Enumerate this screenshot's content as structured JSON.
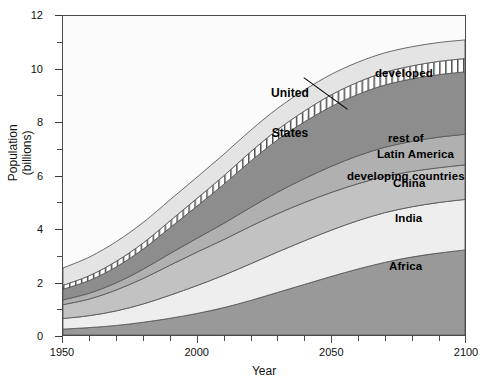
{
  "chart_data": {
    "type": "area",
    "title": "",
    "subtitle": "",
    "xlabel": "Year",
    "ylabel": "Population\n(billions)",
    "ylabel_line1": "Population",
    "ylabel_line2": "(billions)",
    "xlim": [
      1950,
      2100
    ],
    "ylim": [
      0,
      12
    ],
    "xticks": [
      1950,
      2000,
      2050,
      2100
    ],
    "xtick_labels": [
      "1950",
      "2000",
      "2050",
      "2100"
    ],
    "xtick_minor_step": 10,
    "yticks": [
      0,
      2,
      4,
      6,
      8,
      10,
      12
    ],
    "ytick_labels": [
      "0",
      "2",
      "4",
      "6",
      "8",
      "10",
      "12"
    ],
    "ytick_minor_step": 1,
    "grid": false,
    "legend": "in-plot labels",
    "stacked": true,
    "x": [
      1950,
      1960,
      1970,
      1980,
      1990,
      2000,
      2010,
      2020,
      2030,
      2040,
      2050,
      2060,
      2070,
      2080,
      2090,
      2100
    ],
    "series": [
      {
        "name": "Africa",
        "label": "Africa",
        "color": "#999999",
        "pattern": "solid",
        "values": [
          0.22,
          0.28,
          0.36,
          0.48,
          0.63,
          0.81,
          1.03,
          1.3,
          1.6,
          1.9,
          2.2,
          2.48,
          2.73,
          2.93,
          3.08,
          3.2
        ]
      },
      {
        "name": "India",
        "label": "India",
        "color": "#eeeeee",
        "pattern": "solid",
        "values": [
          0.4,
          0.45,
          0.55,
          0.69,
          0.87,
          1.05,
          1.22,
          1.38,
          1.52,
          1.64,
          1.74,
          1.82,
          1.87,
          1.89,
          1.9,
          1.9
        ]
      },
      {
        "name": "China",
        "label": "China",
        "color": "#c2c2c2",
        "pattern": "solid",
        "values": [
          0.52,
          0.63,
          0.79,
          0.96,
          1.13,
          1.26,
          1.34,
          1.41,
          1.44,
          1.44,
          1.42,
          1.39,
          1.36,
          1.33,
          1.31,
          1.3
        ]
      },
      {
        "name": "Latin America",
        "label": "Latin America",
        "color": "#b0b0b0",
        "pattern": "solid",
        "values": [
          0.18,
          0.22,
          0.27,
          0.35,
          0.44,
          0.52,
          0.61,
          0.71,
          0.81,
          0.9,
          0.98,
          1.05,
          1.1,
          1.13,
          1.15,
          1.15
        ]
      },
      {
        "name": "rest of developing countries",
        "label": "rest of\ndeveloping countries",
        "label_line1": "rest of",
        "label_line2": "developing countries",
        "color": "#8d8d8d",
        "pattern": "solid",
        "values": [
          0.4,
          0.48,
          0.6,
          0.76,
          0.97,
          1.21,
          1.47,
          1.74,
          1.97,
          2.13,
          2.25,
          2.31,
          2.34,
          2.35,
          2.35,
          2.35
        ]
      },
      {
        "name": "United States",
        "label": "United\nStates",
        "label_line1": "United",
        "label_line2": "States",
        "color": "#ffffff",
        "pattern": "vertical-hatch",
        "values": [
          0.15,
          0.18,
          0.21,
          0.23,
          0.26,
          0.29,
          0.32,
          0.35,
          0.38,
          0.41,
          0.44,
          0.46,
          0.48,
          0.49,
          0.5,
          0.5
        ]
      },
      {
        "name": "developed",
        "label": "developed",
        "color": "#e4e4e4",
        "pattern": "solid",
        "values": [
          0.65,
          0.7,
          0.74,
          0.77,
          0.79,
          0.8,
          0.81,
          0.81,
          0.8,
          0.79,
          0.77,
          0.75,
          0.73,
          0.72,
          0.71,
          0.7
        ]
      }
    ],
    "cumulative_top": {
      "1950": [
        0.22,
        0.62,
        1.14,
        1.32,
        1.72,
        1.87,
        2.52
      ],
      "2000": [
        0.81,
        1.86,
        3.12,
        3.64,
        4.85,
        5.14,
        5.94
      ],
      "2050": [
        2.2,
        3.94,
        5.36,
        6.34,
        8.59,
        9.03,
        9.8
      ],
      "2100": [
        3.2,
        5.1,
        6.4,
        7.55,
        9.9,
        10.4,
        11.1
      ]
    },
    "annotations": [
      {
        "name": "united-states-leader",
        "text": "United States",
        "points_to": "vertical-hatched band"
      }
    ]
  },
  "labels": {
    "united_states_line1": "United",
    "united_states_line2": "States",
    "developed": "developed",
    "rest_developing_line1": "rest of",
    "rest_developing_line2": "developing countries",
    "latin_america": "Latin America",
    "china": "China",
    "india": "India",
    "africa": "Africa"
  },
  "axes": {
    "x_title": "Year",
    "y_title_line1": "Population",
    "y_title_line2": "(billions)",
    "x_ticks": [
      "1950",
      "2000",
      "2050",
      "2100"
    ],
    "y_ticks": [
      "0",
      "2",
      "4",
      "6",
      "8",
      "10",
      "12"
    ]
  },
  "colors": {
    "plot_background": "#fbfbfb",
    "axis": "#4a4a4a",
    "band_outline": "#5a5a5a",
    "africa": "#999999",
    "india": "#eeeeee",
    "china": "#c2c2c2",
    "latin_america": "#b0b0b0",
    "rest_developing": "#8d8d8d",
    "united_states": "#ffffff",
    "developed": "#e4e4e4"
  }
}
